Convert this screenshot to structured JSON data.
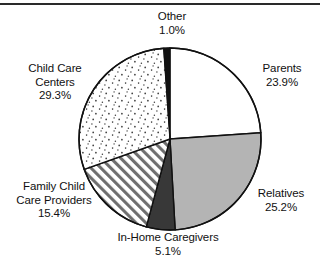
{
  "figure": {
    "has_top_rule": true,
    "background": "#ffffff",
    "width": 320,
    "height": 273
  },
  "chart_data": {
    "type": "pie",
    "title": "",
    "subtitle": "",
    "xlabel": "",
    "ylabel": "",
    "legend_position": "none",
    "grid": false,
    "labels_outside": true,
    "start_angle_deg": 0,
    "direction": "clockwise",
    "categories": [
      "Parents",
      "Relatives",
      "In-Home Caregivers",
      "Family Child Care Providers",
      "Child Care Centers",
      "Other"
    ],
    "values": [
      23.9,
      25.2,
      5.1,
      15.4,
      29.3,
      1.0
    ],
    "value_unit": "percent",
    "slices": [
      {
        "name": "Parents",
        "value": 23.9,
        "display_value": "23.9%",
        "fill_style": "white",
        "fill_color": "#ffffff",
        "start_deg": 0.0,
        "end_deg": 86.04
      },
      {
        "name": "Relatives",
        "value": 25.2,
        "display_value": "25.2%",
        "fill_style": "solid-gray",
        "fill_color": "#b4b4b4",
        "start_deg": 86.04,
        "end_deg": 176.76
      },
      {
        "name": "In-Home Caregivers",
        "value": 5.1,
        "display_value": "5.1%",
        "fill_style": "solid-dark",
        "fill_color": "#383838",
        "start_deg": 176.76,
        "end_deg": 195.12
      },
      {
        "name": "Family Child Care Providers",
        "value": 15.4,
        "display_value": "15.4%",
        "fill_style": "diagonal-hatch",
        "fill_color": "#ffffff",
        "start_deg": 195.12,
        "end_deg": 250.56
      },
      {
        "name": "Child Care Centers",
        "value": 29.3,
        "display_value": "29.3%",
        "fill_style": "stipple-dots",
        "fill_color": "#ffffff",
        "start_deg": 250.56,
        "end_deg": 356.04
      },
      {
        "name": "Other",
        "value": 1.0,
        "display_value": "1.0%",
        "fill_style": "solid-black",
        "fill_color": "#111111",
        "start_deg": 356.04,
        "end_deg": 360.0
      }
    ]
  },
  "labels": {
    "other": {
      "name": "Other",
      "percent": "1.0%"
    },
    "parents": {
      "name": "Parents",
      "percent": "23.9%"
    },
    "relatives": {
      "name": "Relatives",
      "percent": "25.2%"
    },
    "inhome": {
      "name": "In-Home Caregivers",
      "percent": "5.1%"
    },
    "family": {
      "name": "Family Child",
      "name2": "Care Providers",
      "percent": "15.4%"
    },
    "centers": {
      "name": "Child Care",
      "name2": "Centers",
      "percent": "29.3%"
    }
  },
  "colors": {
    "outline": "#111111",
    "gray_slice": "#b4b4b4",
    "dark_slice": "#383838",
    "black_slice": "#111111",
    "text": "#111111",
    "rule": "#2a2a2a"
  }
}
